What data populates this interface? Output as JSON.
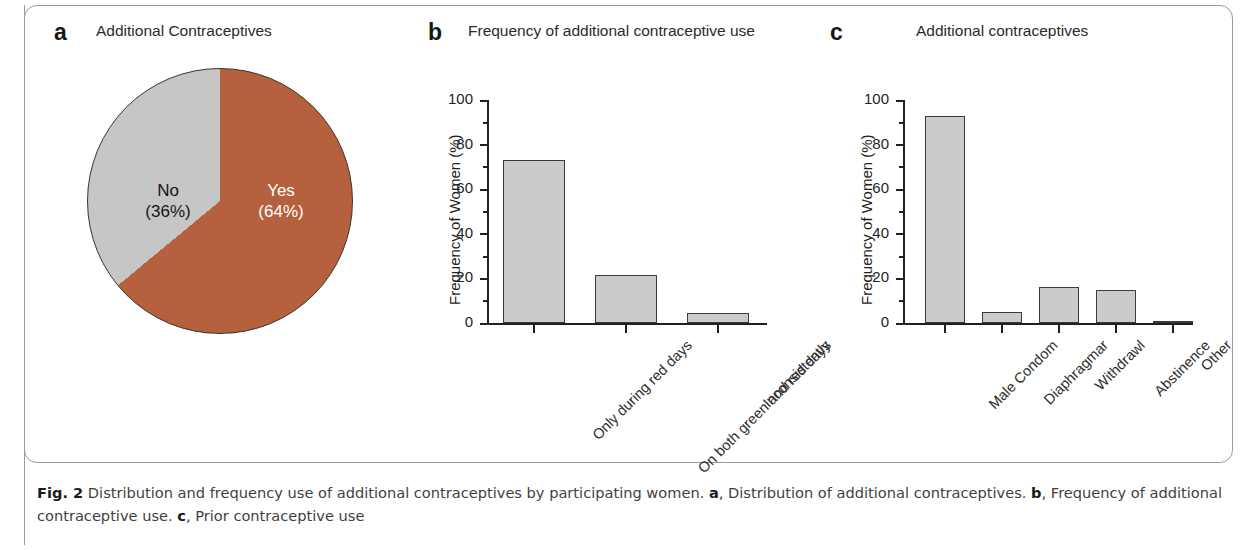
{
  "figure": {
    "caption_label": "Fig. 2",
    "caption_text_1": " Distribution and frequency use of additional contraceptives by participating women. ",
    "caption_a_tag": "a",
    "caption_text_2": ", Distribution of additional contraceptives. ",
    "caption_b_tag": "b",
    "caption_text_3": ", Frequency of additional contraceptive use. ",
    "caption_c_tag": "c",
    "caption_text_4": ", Prior contraceptive use"
  },
  "panels": {
    "a": {
      "letter": "a",
      "title": "Additional Contraceptives"
    },
    "b": {
      "letter": "b",
      "title": "Frequency of additional contraceptive use"
    },
    "c": {
      "letter": "c",
      "title": "Additional contraceptives"
    }
  },
  "colors": {
    "yes_slice": "#b5613d",
    "no_slice": "#c6c6c6",
    "bar_fill": "#cbcbcb",
    "bar_stroke": "#3d3a38",
    "axis": "#231f20"
  },
  "chart_data": [
    {
      "type": "pie",
      "panel": "a",
      "title": "Additional Contraceptives",
      "categories": [
        "Yes",
        "No"
      ],
      "values": [
        64,
        36
      ],
      "labels": [
        "Yes\n(64%)",
        "No\n(36%)"
      ],
      "slice_labels": [
        {
          "name": "Yes",
          "line1": "Yes",
          "line2": "(64%)",
          "percent": 64,
          "color": "#b5613d",
          "text_color": "#ffffff"
        },
        {
          "name": "No",
          "line1": "No",
          "line2": "(36%)",
          "percent": 36,
          "color": "#c6c6c6",
          "text_color": "#141414"
        }
      ],
      "start_angle_deg": 0,
      "direction": "clockwise",
      "legend": "none"
    },
    {
      "type": "bar",
      "panel": "b",
      "title": "Frequency of additional contraceptive use",
      "categories": [
        "Only during red days",
        "On both green and red days",
        "Inconsistently"
      ],
      "values": [
        73,
        21.5,
        4.5
      ],
      "xlabel": "",
      "ylabel": "Frequency of Women (%)",
      "ylim": [
        0,
        100
      ],
      "yticks": [
        0,
        20,
        40,
        60,
        80,
        100
      ],
      "yticks_minor": [
        10,
        30,
        50,
        70,
        90
      ],
      "grid": false,
      "legend": "none",
      "xtick_rotation_deg": -45
    },
    {
      "type": "bar",
      "panel": "c",
      "title": "Additional contraceptives",
      "categories": [
        "Male Condom",
        "Diaphragmar",
        "Withdrawl",
        "Abstinence",
        "Other"
      ],
      "values": [
        93,
        5,
        16,
        15,
        0.5
      ],
      "xlabel": "",
      "ylabel": "Frequency of Women (%)",
      "ylim": [
        0,
        100
      ],
      "yticks": [
        0,
        20,
        40,
        60,
        80,
        100
      ],
      "yticks_minor": [
        10,
        30,
        50,
        70,
        90
      ],
      "grid": false,
      "legend": "none",
      "xtick_rotation_deg": -45
    }
  ]
}
